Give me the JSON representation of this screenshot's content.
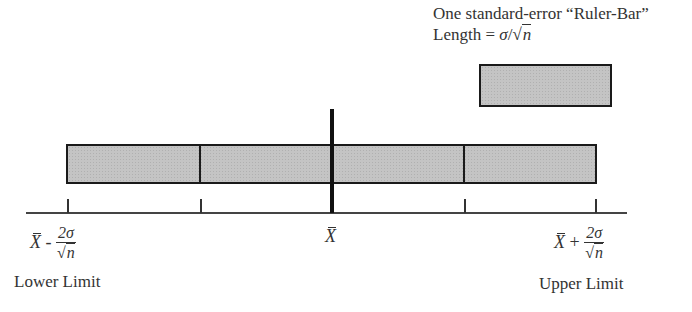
{
  "legend": {
    "line1": "One standard-error “Ruler-Bar”",
    "line2_prefix": "Length = ",
    "line2_sigma": "σ",
    "line2_slash": "/",
    "line2_sqrt": "√",
    "line2_n": "n"
  },
  "axis": {
    "lower": {
      "xbar": "X",
      "op": " - ",
      "numerator": "2σ",
      "sqrt": "√",
      "n": "n",
      "label": "Lower Limit"
    },
    "center": {
      "xbar": "X"
    },
    "upper": {
      "xbar": "X",
      "op": " + ",
      "numerator": "2σ",
      "sqrt": "√",
      "n": "n",
      "label": "Upper Limit"
    }
  },
  "diagram": {
    "ruler_bar_count": 4,
    "bar_fill": "#c4c4c4",
    "outline": "#1a1a1a"
  }
}
